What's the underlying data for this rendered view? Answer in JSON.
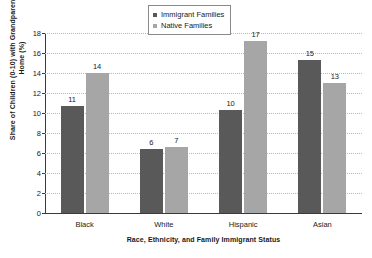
{
  "chart_data": {
    "type": "bar",
    "title": "",
    "categories": [
      "Black",
      "White",
      "Hispanic",
      "Asian"
    ],
    "series": [
      {
        "name": "Immigrant Families",
        "color": "#595959",
        "values": [
          11,
          6,
          10,
          15
        ],
        "plotted": [
          10.7,
          6.4,
          10.3,
          15.3
        ]
      },
      {
        "name": "Native Families",
        "color": "#a6a6a6",
        "values": [
          14,
          7,
          17,
          13
        ],
        "plotted": [
          14.0,
          6.6,
          17.2,
          13.0
        ]
      }
    ],
    "xlabel": "Race, Ethnicity, and Family Immigrant Status",
    "ylabel": "Share of Children (0-10) with Grandparent in the Home (%)",
    "ylim": [
      0,
      18
    ],
    "yticks": [
      0,
      2,
      4,
      6,
      8,
      10,
      12,
      14,
      16,
      18
    ],
    "ytick_labels": [
      "0",
      "2",
      "4",
      "6",
      "8",
      "10",
      "12",
      "14",
      "16",
      "18"
    ],
    "grid": true,
    "grid_axis": "y",
    "legend_position": "top-center"
  },
  "legend": {
    "items": [
      {
        "label": "Immigrant Families",
        "marker": "square-marker-dark"
      },
      {
        "label": "Native Families",
        "marker": "square-marker-light"
      }
    ]
  }
}
